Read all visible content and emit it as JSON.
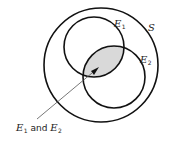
{
  "diagram": {
    "type": "venn",
    "sample_space": {
      "label": "S"
    },
    "events": [
      {
        "label": "E",
        "subscript": "1"
      },
      {
        "label": "E",
        "subscript": "2"
      }
    ],
    "intersection": {
      "annotation_prefix": "E",
      "annotation_sub1": "1",
      "annotation_and": " and ",
      "annotation_suffix": "E",
      "annotation_sub2": "2",
      "fill_color": "#d9d9d9"
    },
    "colors": {
      "stroke": "#111111",
      "background": "#ffffff",
      "shade": "#d9d9d9"
    }
  }
}
